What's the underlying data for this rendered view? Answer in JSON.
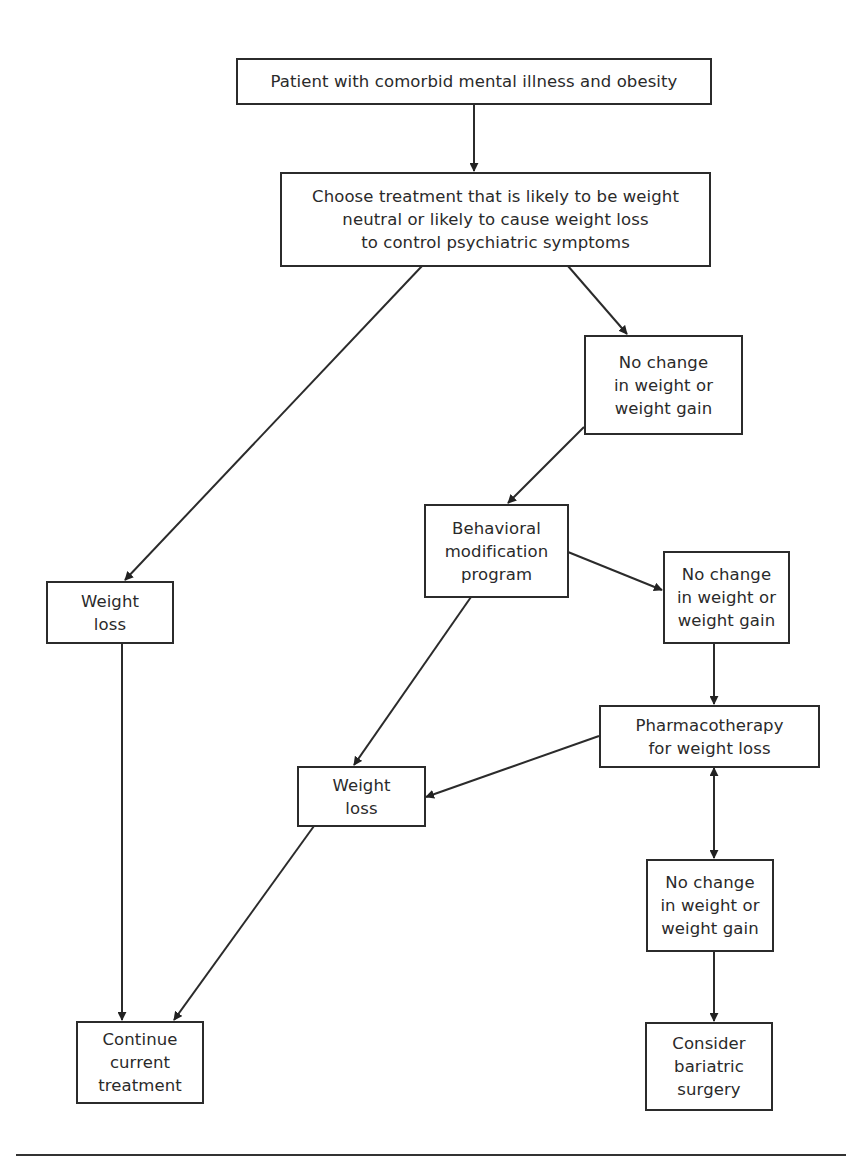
{
  "diagram": {
    "type": "flowchart",
    "nodes": {
      "start": {
        "lines": [
          "Patient with comorbid mental illness and obesity"
        ]
      },
      "choose": {
        "lines": [
          "Choose treatment that is likely to be weight",
          "neutral or likely to cause weight loss",
          "to control psychiatric symptoms"
        ]
      },
      "no_change_1": {
        "lines": [
          "No change",
          "in weight or",
          "weight gain"
        ]
      },
      "weight_loss_1": {
        "lines": [
          "Weight",
          "loss"
        ]
      },
      "behavioral": {
        "lines": [
          "Behavioral",
          "modification",
          "program"
        ]
      },
      "no_change_2": {
        "lines": [
          "No change",
          "in weight or",
          "weight gain"
        ]
      },
      "pharmacotherapy": {
        "lines": [
          "Pharmacotherapy",
          "for weight loss"
        ]
      },
      "weight_loss_2": {
        "lines": [
          "Weight",
          "loss"
        ]
      },
      "no_change_3": {
        "lines": [
          "No change",
          "in weight or",
          "weight gain"
        ]
      },
      "continue": {
        "lines": [
          "Continue",
          "current",
          "treatment"
        ]
      },
      "bariatric": {
        "lines": [
          "Consider",
          "bariatric",
          "surgery"
        ]
      }
    },
    "edges": [
      {
        "from": "start",
        "to": "choose"
      },
      {
        "from": "choose",
        "to": "weight_loss_1"
      },
      {
        "from": "choose",
        "to": "no_change_1"
      },
      {
        "from": "no_change_1",
        "to": "behavioral"
      },
      {
        "from": "behavioral",
        "to": "no_change_2"
      },
      {
        "from": "behavioral",
        "to": "weight_loss_2"
      },
      {
        "from": "no_change_2",
        "to": "pharmacotherapy"
      },
      {
        "from": "pharmacotherapy",
        "to": "weight_loss_2"
      },
      {
        "from": "pharmacotherapy",
        "to": "no_change_3",
        "bidirectional": true
      },
      {
        "from": "no_change_3",
        "to": "bariatric"
      },
      {
        "from": "weight_loss_1",
        "to": "continue"
      },
      {
        "from": "weight_loss_2",
        "to": "continue"
      }
    ]
  }
}
